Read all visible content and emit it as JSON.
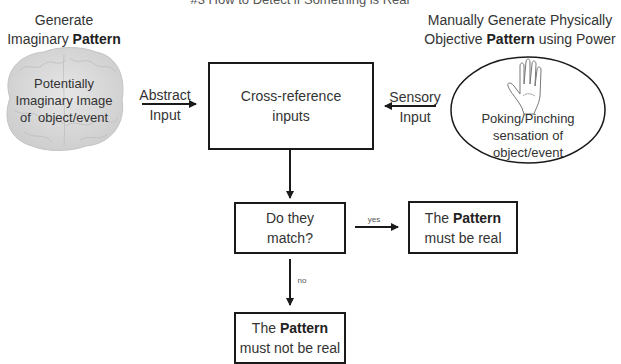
{
  "title": "#3 How to Detect if Something is Real",
  "left_header": {
    "line1": "Generate",
    "line2_pre": "Imaginary ",
    "line2_bold": "Pattern"
  },
  "right_header": {
    "line1": "Manually Generate Physically",
    "line2_pre": "Objective ",
    "line2_bold": "Pattern",
    "line2_post": " using Power"
  },
  "brain": {
    "icon": "brain-icon",
    "lines": [
      "Potentially",
      "Imaginary Image",
      "of  object/event"
    ]
  },
  "hand": {
    "icon": "hand-icon",
    "lines": [
      "Poking/Pinching",
      "sensation of",
      "object/event"
    ]
  },
  "abstract_input": {
    "line1": "Abstract",
    "line2": "Input"
  },
  "sensory_input": {
    "line1": "Sensory",
    "line2": "Input"
  },
  "cross_reference": {
    "line1": "Cross-reference",
    "line2": "inputs"
  },
  "decision": {
    "line1": "Do they",
    "line2": "match?"
  },
  "yes_label": "yes",
  "no_label": "no",
  "real_box": {
    "line1_pre": "The ",
    "line1_bold": "Pattern",
    "line2": "must be real"
  },
  "not_real_box": {
    "line1_pre": "The ",
    "line1_bold": "Pattern",
    "line2": "must not be real"
  },
  "colors": {
    "line": "#1a1a1a",
    "brain": "#d9d9d9",
    "text": "#333333"
  }
}
